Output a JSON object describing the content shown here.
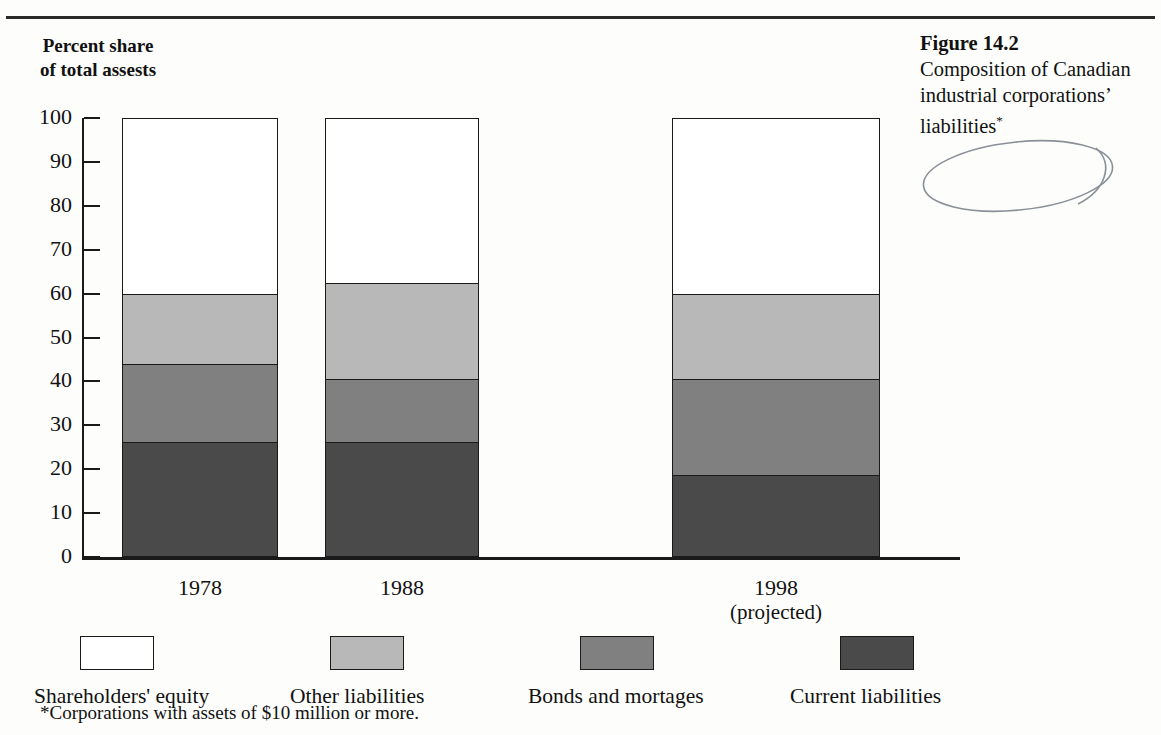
{
  "figure": {
    "number": "Figure 14.2",
    "caption": "Composition of Canadian industrial corporations’ liabilities",
    "caption_marker": "*"
  },
  "footnote": "*Corporations with assets of $10 million or more.",
  "axis_title": "Percent share of total assests",
  "colors": {
    "shareholders_equity": "#ffffff",
    "other_liabilities": "#b8b8b8",
    "bonds_and_mortages": "#808080",
    "current_liabilities": "#4a4a4a",
    "ink": "#1a1a1a",
    "page": "#fdfdfb"
  },
  "chart_data": {
    "type": "bar",
    "subtype": "stacked-vertical",
    "title": "Composition of Canadian industrial corporations’ liabilities",
    "xlabel": "",
    "ylabel": "Percent share of total assests",
    "ylim": [
      0,
      100
    ],
    "yticks": [
      0,
      10,
      20,
      30,
      40,
      50,
      60,
      70,
      80,
      90,
      100
    ],
    "ytick_labels": [
      "0",
      "10",
      "20",
      "30",
      "40",
      "50",
      "60",
      "70",
      "80",
      "90",
      "100"
    ],
    "grid": false,
    "legend_position": "bottom",
    "categories": [
      "1978",
      "1988",
      "1998"
    ],
    "category_sublabels": [
      "",
      "",
      "(projected)"
    ],
    "stack_order_bottom_to_top": [
      "Current liabilities",
      "Bonds and mortages",
      "Other liabilities",
      "Shareholders' equity"
    ],
    "series": [
      {
        "name": "Current liabilities",
        "color": "#4a4a4a",
        "values": [
          26.0,
          26.0,
          18.5
        ]
      },
      {
        "name": "Bonds and mortages",
        "color": "#808080",
        "values": [
          18.0,
          14.5,
          22.0
        ]
      },
      {
        "name": "Other liabilities",
        "color": "#b8b8b8",
        "values": [
          16.0,
          22.0,
          19.5
        ]
      },
      {
        "name": "Shareholders' equity",
        "color": "#ffffff",
        "values": [
          40.0,
          37.5,
          40.0
        ]
      }
    ],
    "cumulative_boundaries": {
      "1978": [
        26.0,
        44.0,
        60.0,
        100.0
      ],
      "1988": [
        26.0,
        40.5,
        62.5,
        100.0
      ],
      "1998": [
        18.5,
        40.5,
        60.0,
        100.0
      ]
    }
  },
  "bars": [
    {
      "category": "1978",
      "sublabel": "",
      "left_pct": 4.55,
      "width_pct": 17.8,
      "segments": [
        {
          "name": "Shareholders' equity",
          "value": 40.0,
          "color": "#ffffff"
        },
        {
          "name": "Other liabilities",
          "value": 16.0,
          "color": "#b8b8b8"
        },
        {
          "name": "Bonds and mortages",
          "value": 18.0,
          "color": "#808080"
        },
        {
          "name": "Current liabilities",
          "value": 26.0,
          "color": "#4a4a4a"
        }
      ]
    },
    {
      "category": "1988",
      "sublabel": "",
      "left_pct": 27.7,
      "width_pct": 17.5,
      "segments": [
        {
          "name": "Shareholders' equity",
          "value": 37.5,
          "color": "#ffffff"
        },
        {
          "name": "Other liabilities",
          "value": 22.0,
          "color": "#b8b8b8"
        },
        {
          "name": "Bonds and mortages",
          "value": 14.5,
          "color": "#808080"
        },
        {
          "name": "Current liabilities",
          "value": 26.0,
          "color": "#4a4a4a"
        }
      ]
    },
    {
      "category": "1998",
      "sublabel": "(projected)",
      "left_pct": 67.2,
      "width_pct": 23.7,
      "segments": [
        {
          "name": "Shareholders' equity",
          "value": 40.0,
          "color": "#ffffff"
        },
        {
          "name": "Other liabilities",
          "value": 19.5,
          "color": "#b8b8b8"
        },
        {
          "name": "Bonds and mortages",
          "value": 22.0,
          "color": "#808080"
        },
        {
          "name": "Current liabilities",
          "value": 18.5,
          "color": "#4a4a4a"
        }
      ]
    }
  ],
  "legend": [
    {
      "label": "Shareholders' equity",
      "color": "#ffffff",
      "swatch_x": 80,
      "label_x": 34
    },
    {
      "label": "Other liabilities",
      "color": "#b8b8b8",
      "swatch_x": 330,
      "label_x": 290
    },
    {
      "label": "Bonds and mortages",
      "color": "#808080",
      "swatch_x": 580,
      "label_x": 528
    },
    {
      "label": "Current liabilities",
      "color": "#4a4a4a",
      "swatch_x": 840,
      "label_x": 790
    }
  ]
}
